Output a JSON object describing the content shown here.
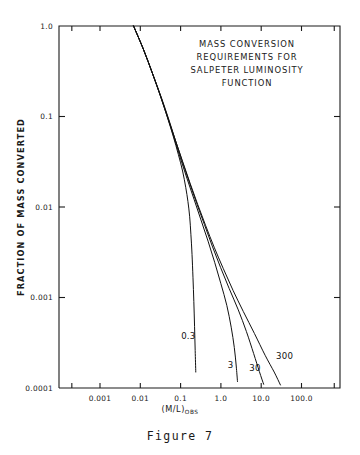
{
  "caption": "Figure 7",
  "chart_data": {
    "type": "line",
    "title_lines": [
      "MASS  CONVERSION",
      "REQUIREMENTS  FOR",
      "SALPETER  LUMINOSITY",
      "FUNCTION"
    ],
    "xlabel": "(M/L)",
    "xlabel_subscript": "OBS",
    "ylabel": "FRACTION OF MASS CONVERTED",
    "xscale": "log",
    "yscale": "log",
    "xlim": [
      0.0002,
      650
    ],
    "ylim": [
      0.0001,
      1.0
    ],
    "grid": false,
    "legend": "inline-curve-labels",
    "xticks": [
      {
        "value": 0.001,
        "label": "0.001"
      },
      {
        "value": 0.01,
        "label": "0.01"
      },
      {
        "value": 0.1,
        "label": "0.1"
      },
      {
        "value": 1.0,
        "label": "1.0"
      },
      {
        "value": 10.0,
        "label": "10.0"
      },
      {
        "value": 100.0,
        "label": "100.0"
      }
    ],
    "yticks": [
      {
        "value": 1.0,
        "label": "1.0"
      },
      {
        "value": 0.1,
        "label": "0.1"
      },
      {
        "value": 0.01,
        "label": "0.01"
      },
      {
        "value": 0.001,
        "label": "0.001"
      },
      {
        "value": 0.0001,
        "label": "0.0001"
      }
    ],
    "series": [
      {
        "name": "0.3",
        "label": "0.3",
        "points": [
          [
            0.0068,
            1.0
          ],
          [
            0.012,
            0.55
          ],
          [
            0.02,
            0.3
          ],
          [
            0.032,
            0.165
          ],
          [
            0.047,
            0.098
          ],
          [
            0.066,
            0.06
          ],
          [
            0.088,
            0.038
          ],
          [
            0.112,
            0.025
          ],
          [
            0.134,
            0.0165
          ],
          [
            0.152,
            0.0115
          ],
          [
            0.168,
            0.0078
          ],
          [
            0.18,
            0.005
          ],
          [
            0.192,
            0.003
          ],
          [
            0.203,
            0.00165
          ],
          [
            0.213,
            0.0009
          ],
          [
            0.222,
            0.00048
          ],
          [
            0.23,
            0.00026
          ],
          [
            0.238,
            0.00015
          ]
        ]
      },
      {
        "name": "3",
        "label": "3",
        "points": [
          [
            0.0068,
            1.0
          ],
          [
            0.012,
            0.55
          ],
          [
            0.02,
            0.3
          ],
          [
            0.032,
            0.165
          ],
          [
            0.048,
            0.096
          ],
          [
            0.07,
            0.057
          ],
          [
            0.1,
            0.034
          ],
          [
            0.145,
            0.0205
          ],
          [
            0.215,
            0.0122
          ],
          [
            0.32,
            0.0072
          ],
          [
            0.48,
            0.0042
          ],
          [
            0.7,
            0.00245
          ],
          [
            1.0,
            0.00142
          ],
          [
            1.4,
            0.00082
          ],
          [
            1.8,
            0.00047
          ],
          [
            2.15,
            0.00028
          ],
          [
            2.4,
            0.000175
          ],
          [
            2.58,
            0.000118
          ]
        ]
      },
      {
        "name": "30",
        "label": "30",
        "points": [
          [
            0.0068,
            1.0
          ],
          [
            0.012,
            0.55
          ],
          [
            0.02,
            0.3
          ],
          [
            0.033,
            0.163
          ],
          [
            0.05,
            0.094
          ],
          [
            0.074,
            0.055
          ],
          [
            0.11,
            0.032
          ],
          [
            0.165,
            0.0188
          ],
          [
            0.25,
            0.011
          ],
          [
            0.39,
            0.0064
          ],
          [
            0.61,
            0.0037
          ],
          [
            0.98,
            0.00215
          ],
          [
            1.6,
            0.00126
          ],
          [
            2.7,
            0.00073
          ],
          [
            4.3,
            0.00042
          ],
          [
            6.5,
            0.00024
          ],
          [
            9.0,
            0.000152
          ],
          [
            11.5,
            0.00011
          ]
        ]
      },
      {
        "name": "300",
        "label": "300",
        "points": [
          [
            0.0068,
            1.0
          ],
          [
            0.012,
            0.55
          ],
          [
            0.02,
            0.3
          ],
          [
            0.033,
            0.163
          ],
          [
            0.05,
            0.094
          ],
          [
            0.075,
            0.054
          ],
          [
            0.113,
            0.0315
          ],
          [
            0.172,
            0.0183
          ],
          [
            0.265,
            0.0107
          ],
          [
            0.42,
            0.0062
          ],
          [
            0.68,
            0.0036
          ],
          [
            1.15,
            0.00208
          ],
          [
            2.0,
            0.0012
          ],
          [
            3.6,
            0.0007
          ],
          [
            6.8,
            0.0004
          ],
          [
            12.5,
            0.00023
          ],
          [
            21.0,
            0.00015
          ],
          [
            30.0,
            0.000108
          ]
        ]
      }
    ],
    "curve_labels": [
      {
        "text": "0.3",
        "x": 0.155,
        "y": 0.00035
      },
      {
        "text": "3",
        "x": 1.75,
        "y": 0.000165
      },
      {
        "text": "30",
        "x": 7.0,
        "y": 0.000155
      },
      {
        "text": "300",
        "x": 38.0,
        "y": 0.00021
      }
    ]
  }
}
